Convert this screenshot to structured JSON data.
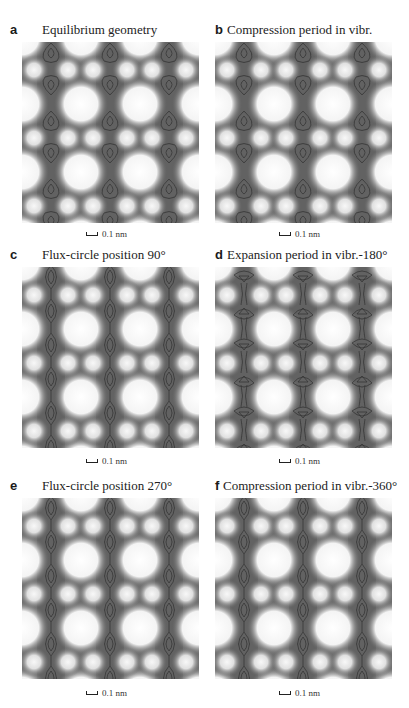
{
  "figure": {
    "panels": [
      {
        "letter": "a",
        "title": "Equilibrium geometry",
        "scale_label": "0.1 nm",
        "contour_style": "pear"
      },
      {
        "letter": "b",
        "title": "Compression period in vibr.",
        "scale_label": "0.1 nm",
        "contour_style": "pear"
      },
      {
        "letter": "c",
        "title": "Flux-circle position 90°",
        "scale_label": "0.1 nm",
        "contour_style": "chain"
      },
      {
        "letter": "d",
        "title": "Expansion period in vibr.-180°",
        "scale_label": "0.1 nm",
        "contour_style": "hourglass"
      },
      {
        "letter": "e",
        "title": "Flux-circle position 270°",
        "scale_label": "0.1 nm",
        "contour_style": "chain"
      },
      {
        "letter": "f",
        "title": "Compression period in vibr.-360°",
        "scale_label": "0.1 nm",
        "contour_style": "chain"
      }
    ],
    "colors": {
      "background": "#6e6e6e",
      "bright": "#ffffff",
      "contour": "#2a2a2a",
      "column_dark": "#5a5a5a"
    }
  }
}
